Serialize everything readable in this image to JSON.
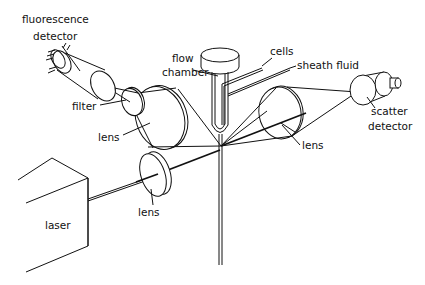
{
  "diagram": {
    "type": "flow cytometer schematic",
    "labels": {
      "fluorescence": "fluorescence",
      "detector1": "detector",
      "filter": "filter",
      "lens_left": "lens",
      "flow": "flow",
      "chamber": "chamber",
      "cells": "cells",
      "sheath_fluid": "sheath fluid",
      "scatter": "scatter",
      "detector2": "detector",
      "lens_right": "lens",
      "lens_bottom": "lens",
      "laser": "laser"
    },
    "components": [
      "laser",
      "focusing lens",
      "flow chamber",
      "cells inlet",
      "sheath fluid inlet",
      "collection lens (fluorescence)",
      "filter",
      "fluorescence detector",
      "collection lens (scatter)",
      "scatter detector"
    ],
    "colors": {
      "line": "#111111",
      "background": "#ffffff"
    }
  }
}
